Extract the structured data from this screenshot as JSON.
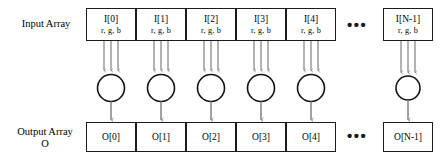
{
  "diagram": {
    "colors": {
      "box_stroke": "#1a1a1a",
      "arrow": "#8a8a8a",
      "circle_stroke": "#111111",
      "background": "#ffffff",
      "text": "#000000"
    },
    "rows": {
      "input": {
        "label": "Input Array",
        "channels": "r, g, b",
        "cells": [
          {
            "index": "I[0]",
            "channels": "r, g, b"
          },
          {
            "index": "I[1]",
            "channels": "r, g, b"
          },
          {
            "index": "I[2]",
            "channels": "r, g, b"
          },
          {
            "index": "I[3]",
            "channels": "r, g, b"
          },
          {
            "index": "I[4]",
            "channels": "r, g, b"
          },
          {
            "index": "I[N-1]",
            "channels": "r, g, b"
          }
        ],
        "ellipsis": "•••"
      },
      "output": {
        "label": "Output Array",
        "label_sub": "O",
        "cells": [
          {
            "index": "O[0]"
          },
          {
            "index": "O[1]"
          },
          {
            "index": "O[2]"
          },
          {
            "index": "O[3]"
          },
          {
            "index": "O[4]"
          },
          {
            "index": "O[N-1]"
          }
        ],
        "ellipsis": "•••"
      }
    },
    "operators": {
      "count": 6,
      "shape": "circle",
      "inputs_per_operator": 3,
      "outputs_per_operator": 1
    }
  }
}
